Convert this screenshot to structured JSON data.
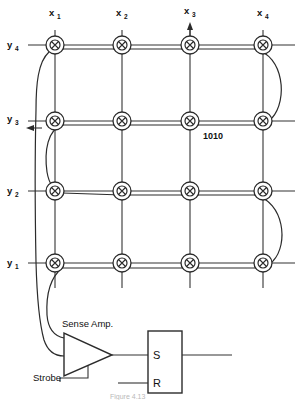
{
  "figure": {
    "caption": "Figure 4.13"
  },
  "grid": {
    "columns": [
      {
        "id": "x1",
        "label": "x",
        "sub": "1",
        "x": 55,
        "drive_arrow": false
      },
      {
        "id": "x2",
        "label": "x",
        "sub": "2",
        "x": 122,
        "drive_arrow": false
      },
      {
        "id": "x3",
        "label": "x",
        "sub": "3",
        "x": 190,
        "drive_arrow": true
      },
      {
        "id": "x4",
        "label": "x",
        "sub": "4",
        "x": 263,
        "drive_arrow": false
      }
    ],
    "rows": [
      {
        "id": "y4",
        "label": "y",
        "sub": "4",
        "y": 45,
        "drive_arrow": false
      },
      {
        "id": "y3",
        "label": "y",
        "sub": "3",
        "y": 121,
        "drive_arrow": true
      },
      {
        "id": "y2",
        "label": "y",
        "sub": "2",
        "y": 191,
        "drive_arrow": false
      },
      {
        "id": "y1",
        "label": "y",
        "sub": "1",
        "y": 263,
        "drive_arrow": false
      }
    ],
    "core_count": 16,
    "core_outer_radius": 9,
    "core_inner_radius": 5
  },
  "annotations": {
    "data_word": "1010",
    "data_word_x": 203,
    "data_word_y": 137
  },
  "circuit": {
    "sense_amp_label": "Sense Amp.",
    "strobe_label": "Strobe",
    "flipflop_set_label": "S",
    "flipflop_reset_label": "R"
  },
  "colors": {
    "ink": "#2b2b2b",
    "wire": "#333333",
    "background": "#ffffff",
    "caption": "#b9b9b9"
  }
}
